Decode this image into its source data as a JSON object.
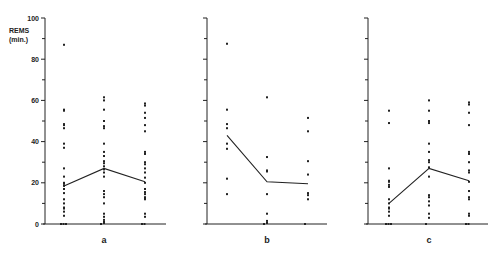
{
  "chart_data": {
    "type": "scatter",
    "subtype": "dot-strip with mean line",
    "ylabel": "REMS (min.)",
    "ylabel_lines": [
      "REMS",
      "(min.)"
    ],
    "ylim": [
      0,
      100
    ],
    "yticks": [
      0,
      20,
      40,
      60,
      80,
      100
    ],
    "minor_tick_step": 10,
    "grid": false,
    "legend": null,
    "panels": [
      {
        "label": "a",
        "columns": [
          {
            "values": [
              87,
              55.5,
              55,
              48.5,
              48,
              46.5,
              39,
              37,
              27,
              23,
              20,
              19.5,
              18.5,
              17,
              15,
              12,
              10,
              8,
              7.5,
              6,
              4,
              0,
              0,
              0
            ],
            "mean": 18.5
          },
          {
            "values": [
              61.5,
              60,
              55.5,
              50,
              47.5,
              46.5,
              39,
              35,
              33,
              30.5,
              29.5,
              28,
              26.5,
              25,
              23,
              16,
              14.5,
              13,
              10,
              5,
              3.5,
              2,
              1,
              0.5,
              0
            ],
            "mean": 27
          },
          {
            "values": [
              58.5,
              57.5,
              54,
              51.5,
              48,
              45,
              35,
              34,
              30,
              29,
              27,
              25,
              22.5,
              20,
              17,
              15.5,
              14.5,
              13,
              12.5,
              12,
              5,
              3.5,
              0,
              0
            ],
            "mean": 20.5
          }
        ]
      },
      {
        "label": "b",
        "columns": [
          {
            "values": [
              87.5,
              55.5,
              48.5,
              46.5,
              39,
              36.5,
              22,
              14.5
            ],
            "mean": 43
          },
          {
            "values": [
              61.5,
              32.5,
              26,
              25.5,
              14.5,
              5,
              1.5,
              0.5,
              0
            ],
            "mean": 20.5
          },
          {
            "values": [
              51.5,
              45,
              30.5,
              24,
              15,
              14,
              12,
              0
            ],
            "mean": 19.5
          }
        ]
      },
      {
        "label": "c",
        "columns": [
          {
            "values": [
              55,
              49,
              27,
              21,
              20.5,
              19,
              18,
              12,
              10,
              8,
              7.5,
              6,
              4,
              0,
              0,
              0
            ],
            "mean": 10
          },
          {
            "values": [
              60,
              55,
              50,
              49,
              39,
              35,
              31,
              30,
              27.5,
              23,
              14,
              13,
              11,
              9,
              5,
              3,
              0
            ],
            "mean": 27
          },
          {
            "values": [
              59,
              58,
              54,
              48,
              35,
              34,
              30,
              26,
              25,
              20.5,
              16,
              13,
              12,
              5,
              4,
              0,
              0
            ],
            "mean": 21
          }
        ]
      }
    ]
  },
  "colors": {
    "ink": "#222222",
    "background": "#ffffff"
  }
}
